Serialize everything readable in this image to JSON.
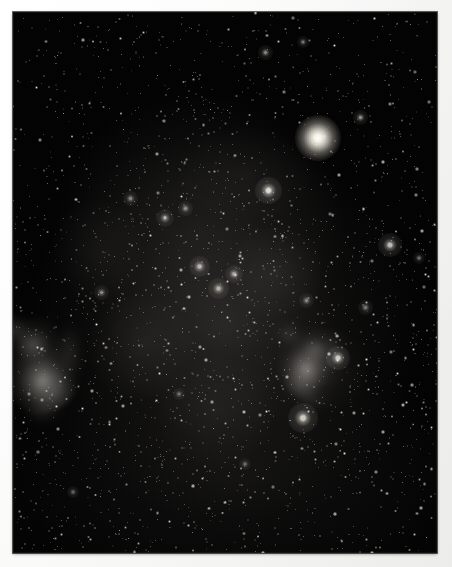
{
  "image": {
    "kind": "astrophotograph",
    "subject": "deep-sky star field with nebulae and a bright globular cluster",
    "orientation": "portrait",
    "width_px": 452,
    "height_px": 567,
    "border": {
      "style": "photographic print mount",
      "color": "#fbfbfa",
      "left_px": 13,
      "top_px": 12,
      "right_px": 15,
      "bottom_px": 14
    },
    "plate": {
      "x": 13,
      "y": 12,
      "width": 424,
      "height": 541,
      "background_color": "#030303",
      "dominant_colors": [
        "#000000",
        "#1a1917",
        "#8e8a83",
        "#fffef7"
      ]
    }
  },
  "chart_data": {
    "type": "scatter",
    "title": "",
    "xlabel": "",
    "ylabel": "",
    "grid": false,
    "legend": "none",
    "xlim": [
      0,
      424
    ],
    "ylim": [
      0,
      541
    ],
    "objects": [
      {
        "name": "globular-cluster",
        "x": 305,
        "y": 126,
        "size": 46,
        "brightness": 1.0,
        "color": "#fffdf3"
      },
      {
        "name": "nebula-left-irregular",
        "x": 28,
        "y": 343,
        "size": 78,
        "brightness": 0.62,
        "color": "#b9b5ac"
      },
      {
        "name": "nebula-right-irregular",
        "x": 297,
        "y": 343,
        "size": 62,
        "brightness": 0.58,
        "color": "#b2aea5"
      },
      {
        "name": "star-bright-1",
        "x": 255,
        "y": 178,
        "size": 9,
        "brightness": 0.86,
        "color": "#fffaf0"
      },
      {
        "name": "star-bright-2",
        "x": 290,
        "y": 406,
        "size": 10,
        "brightness": 0.8,
        "color": "#fff8ec"
      },
      {
        "name": "star-bright-3",
        "x": 377,
        "y": 233,
        "size": 8,
        "brightness": 0.74,
        "color": "#fff9ef"
      },
      {
        "name": "star-bright-4",
        "x": 325,
        "y": 346,
        "size": 8,
        "brightness": 0.78,
        "color": "#fffdf6"
      },
      {
        "name": "star-bright-5",
        "x": 186,
        "y": 254,
        "size": 7,
        "brightness": 0.7,
        "color": "#f7f4ec"
      },
      {
        "name": "star-bright-6",
        "x": 205,
        "y": 276,
        "size": 7,
        "brightness": 0.68,
        "color": "#f5f2ea"
      },
      {
        "name": "star-bright-7",
        "x": 221,
        "y": 262,
        "size": 6,
        "brightness": 0.64,
        "color": "#efece4"
      },
      {
        "name": "star-bright-8",
        "x": 152,
        "y": 206,
        "size": 6,
        "brightness": 0.6,
        "color": "#eeebe3"
      },
      {
        "name": "star-bright-9",
        "x": 172,
        "y": 196,
        "size": 5,
        "brightness": 0.56,
        "color": "#e9e6de"
      },
      {
        "name": "star-bright-10",
        "x": 117,
        "y": 186,
        "size": 5,
        "brightness": 0.54,
        "color": "#e7e4dc"
      },
      {
        "name": "star-bright-11",
        "x": 347,
        "y": 105,
        "size": 5,
        "brightness": 0.58,
        "color": "#f2efe7"
      },
      {
        "name": "star-bright-12",
        "x": 252,
        "y": 40,
        "size": 5,
        "brightness": 0.55,
        "color": "#f0ede5"
      },
      {
        "name": "star-bright-13",
        "x": 290,
        "y": 30,
        "size": 4,
        "brightness": 0.5,
        "color": "#eae7df"
      },
      {
        "name": "star-bright-14",
        "x": 88,
        "y": 280,
        "size": 5,
        "brightness": 0.52,
        "color": "#eae7df"
      },
      {
        "name": "star-bright-15",
        "x": 293,
        "y": 288,
        "size": 5,
        "brightness": 0.52,
        "color": "#e6e3db"
      },
      {
        "name": "star-bright-16",
        "x": 352,
        "y": 295,
        "size": 5,
        "brightness": 0.5,
        "color": "#e5e2da"
      },
      {
        "name": "star-bright-17",
        "x": 406,
        "y": 246,
        "size": 4,
        "brightness": 0.48,
        "color": "#e2dfd7"
      },
      {
        "name": "star-bright-18",
        "x": 232,
        "y": 452,
        "size": 4,
        "brightness": 0.46,
        "color": "#e0ddd5"
      },
      {
        "name": "star-bright-19",
        "x": 166,
        "y": 382,
        "size": 4,
        "brightness": 0.46,
        "color": "#dedbd3"
      },
      {
        "name": "star-bright-20",
        "x": 60,
        "y": 480,
        "size": 4,
        "brightness": 0.44,
        "color": "#dcd9d1"
      }
    ],
    "background_field": {
      "description": "dense uniform field of several thousand faint stars",
      "approx_star_count": 2600,
      "faint_star_color": "#cfcbc3"
    }
  },
  "overlay": {
    "has_text": false,
    "has_controls": false,
    "labels": []
  }
}
